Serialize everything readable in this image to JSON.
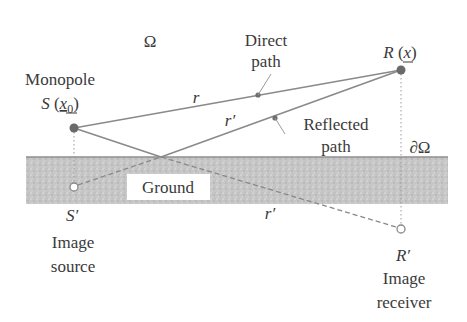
{
  "diagram": {
    "domain_label": "Ω",
    "boundary_label": "∂Ω",
    "ground_label": "Ground",
    "source": {
      "title": "Monopole",
      "symbol": "S",
      "coord_open": "(",
      "coord_var": "x",
      "coord_sub": "0",
      "coord_close": ")"
    },
    "receiver": {
      "symbol": "R",
      "coord_open": "(",
      "coord_var": "x",
      "coord_close": ")"
    },
    "image_source": {
      "symbol": "S′",
      "line1": "Image",
      "line2": "source"
    },
    "image_receiver": {
      "symbol": "R′",
      "line1": "Image",
      "line2": "receiver"
    },
    "direct_path": {
      "line1": "Direct",
      "line2": "path",
      "distance": "r"
    },
    "reflected_path": {
      "line1": "Reflected",
      "line2": "path",
      "distance": "r′"
    },
    "image_path_distance": "r′",
    "colors": {
      "line": "#8a8a8a",
      "dot": "#6e6e6e",
      "ground": "#c4c4c4",
      "ground_edge": "#9a9a9a",
      "text": "#3a3a3a"
    }
  }
}
